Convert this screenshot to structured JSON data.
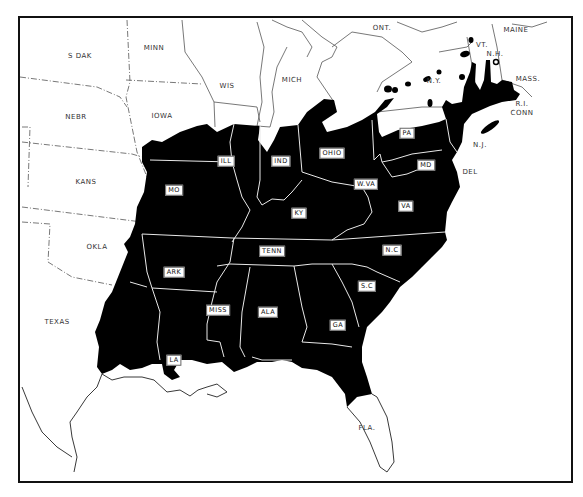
{
  "map": {
    "fill_color": "#000000",
    "background_color": "#ffffff",
    "outline_color": "#111111",
    "labels_outside": [
      {
        "id": "s-dak",
        "text": "S DAK",
        "x": 78,
        "y": 54
      },
      {
        "id": "minn",
        "text": "MINN",
        "x": 152,
        "y": 46
      },
      {
        "id": "wis",
        "text": "WIS",
        "x": 225,
        "y": 84
      },
      {
        "id": "mich",
        "text": "MICH",
        "x": 290,
        "y": 78
      },
      {
        "id": "ont",
        "text": "ONT.",
        "x": 380,
        "y": 26
      },
      {
        "id": "maine",
        "text": "MAINE",
        "x": 514,
        "y": 28
      },
      {
        "id": "vt",
        "text": "VT.",
        "x": 480,
        "y": 43
      },
      {
        "id": "nh",
        "text": "N.H.",
        "x": 493,
        "y": 52
      },
      {
        "id": "ny",
        "text": "N.Y.",
        "x": 432,
        "y": 79
      },
      {
        "id": "mass",
        "text": "MASS.",
        "x": 526,
        "y": 77
      },
      {
        "id": "ri",
        "text": "R.I.",
        "x": 520,
        "y": 102
      },
      {
        "id": "conn",
        "text": "CONN",
        "x": 520,
        "y": 111
      },
      {
        "id": "nj",
        "text": "N.J.",
        "x": 478,
        "y": 143
      },
      {
        "id": "del",
        "text": "DEL",
        "x": 468,
        "y": 170
      },
      {
        "id": "nebr",
        "text": "NEBR",
        "x": 74,
        "y": 115
      },
      {
        "id": "iowa",
        "text": "IOWA",
        "x": 160,
        "y": 114
      },
      {
        "id": "kans",
        "text": "KANS",
        "x": 84,
        "y": 180
      },
      {
        "id": "okla",
        "text": "OKLA",
        "x": 95,
        "y": 245
      },
      {
        "id": "texas",
        "text": "TEXAS",
        "x": 55,
        "y": 320
      },
      {
        "id": "fla",
        "text": "FLA.",
        "x": 365,
        "y": 426
      }
    ],
    "labels_boxed": [
      {
        "id": "ill",
        "text": "ILL",
        "x": 224,
        "y": 159
      },
      {
        "id": "ind",
        "text": "IND",
        "x": 279,
        "y": 159
      },
      {
        "id": "ohio",
        "text": "OHIO",
        "x": 330,
        "y": 151
      },
      {
        "id": "pa",
        "text": "PA",
        "x": 405,
        "y": 131
      },
      {
        "id": "mo",
        "text": "MO",
        "x": 172,
        "y": 188
      },
      {
        "id": "wva",
        "text": "W.VA",
        "x": 364,
        "y": 182
      },
      {
        "id": "md",
        "text": "MD",
        "x": 424,
        "y": 163
      },
      {
        "id": "ky",
        "text": "KY",
        "x": 297,
        "y": 211
      },
      {
        "id": "va",
        "text": "VA",
        "x": 404,
        "y": 204
      },
      {
        "id": "tenn",
        "text": "TENN",
        "x": 270,
        "y": 249
      },
      {
        "id": "nc",
        "text": "N.C",
        "x": 390,
        "y": 248
      },
      {
        "id": "ark",
        "text": "ARK",
        "x": 172,
        "y": 270
      },
      {
        "id": "sc",
        "text": "S.C",
        "x": 365,
        "y": 284
      },
      {
        "id": "miss",
        "text": "MISS",
        "x": 216,
        "y": 308
      },
      {
        "id": "ala",
        "text": "ALA",
        "x": 266,
        "y": 310
      },
      {
        "id": "ga",
        "text": "GA",
        "x": 336,
        "y": 323
      },
      {
        "id": "la",
        "text": "LA",
        "x": 172,
        "y": 358
      }
    ]
  }
}
